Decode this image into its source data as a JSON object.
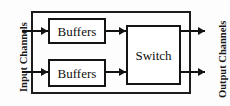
{
  "diagram": {
    "labels": {
      "input_channels": "Input Channels",
      "output_channels": "Output Channels"
    },
    "blocks": [
      {
        "id": "buffers-1",
        "label": "Buffers"
      },
      {
        "id": "buffers-2",
        "label": "Buffers"
      },
      {
        "id": "switch",
        "label": "Switch"
      }
    ],
    "connectors": [
      {
        "id": "input-1",
        "from": "input-channels",
        "to": "buffers-1",
        "direction": "right"
      },
      {
        "id": "input-2",
        "from": "input-channels",
        "to": "buffers-2",
        "direction": "right"
      },
      {
        "id": "mid-1",
        "from": "buffers-1",
        "to": "switch",
        "direction": "right"
      },
      {
        "id": "mid-2",
        "from": "buffers-2",
        "to": "switch",
        "direction": "right"
      },
      {
        "id": "output-1",
        "from": "switch",
        "to": "output-channels",
        "direction": "right"
      },
      {
        "id": "output-2",
        "from": "switch",
        "to": "output-channels",
        "direction": "right"
      }
    ],
    "colors": {
      "stroke": "#121212",
      "background": "#ffffff",
      "text": "#101010"
    }
  }
}
